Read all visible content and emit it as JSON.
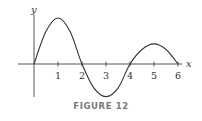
{
  "figure": {
    "caption": "FIGURE 12",
    "x_axis_label": "x",
    "y_axis_label": "y",
    "colors": {
      "curve": "#333333",
      "axes": "#555555",
      "caption": "#7a7a7a"
    }
  },
  "chart_data": {
    "type": "line",
    "title": "",
    "caption": "FIGURE 12",
    "xlabel": "x",
    "ylabel": "y",
    "x_ticks": [
      1,
      2,
      3,
      4,
      5,
      6
    ],
    "y_ticks": [],
    "xlim": [
      -0.7,
      6.4
    ],
    "ylim": [
      -1.4,
      1.9
    ],
    "grid": false,
    "legend": null,
    "series": [
      {
        "name": "curve",
        "x": [
          0,
          0.5,
          1,
          1.5,
          2,
          2.5,
          3,
          3.5,
          4,
          4.5,
          5,
          5.5,
          6
        ],
        "y": [
          0,
          1.35,
          1.9,
          1.35,
          0,
          -1.0,
          -1.35,
          -1.0,
          0,
          0.6,
          0.83,
          0.6,
          0
        ]
      }
    ],
    "annotations": [
      "Local max at x=1",
      "Zero crossings at x=0, 2, 4, 6",
      "Local min at x=3",
      "Local max at x=5 (smaller than at x=1)"
    ]
  }
}
